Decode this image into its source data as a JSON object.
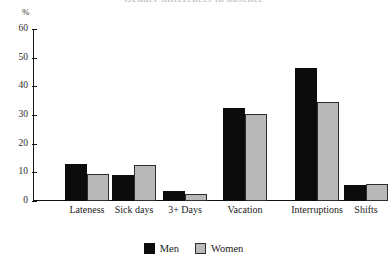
{
  "figure": {
    "title_cutoff": "Gender differences in absence",
    "axis_unit": "%"
  },
  "legend": {
    "position": "bottom-center",
    "items": [
      {
        "label": "Men",
        "color": "#0c0c0c",
        "swatch": "men-swatch"
      },
      {
        "label": "Women",
        "color": "#b9b9b9",
        "swatch": "women-swatch"
      }
    ]
  },
  "chart_data": {
    "type": "bar",
    "title": "",
    "xlabel": "",
    "ylabel": "%",
    "ylim": [
      0,
      60
    ],
    "yticks": [
      0,
      10,
      20,
      30,
      40,
      50,
      60
    ],
    "ytick_labels": [
      "0",
      "10",
      "20",
      "30",
      "40",
      "50",
      "60"
    ],
    "grid": false,
    "legend_position": "bottom-center",
    "categories": [
      "Lateness",
      "Sick days",
      "3+ Days",
      "Vacation",
      "Interruptions",
      "Shifts"
    ],
    "series": [
      {
        "name": "Men",
        "color": "#0c0c0c",
        "values": [
          13,
          9,
          3.5,
          32.5,
          46.5,
          5.5
        ]
      },
      {
        "name": "Women",
        "color": "#b9b9b9",
        "values": [
          9.5,
          12.5,
          2.5,
          30.5,
          34.5,
          6
        ]
      }
    ]
  }
}
